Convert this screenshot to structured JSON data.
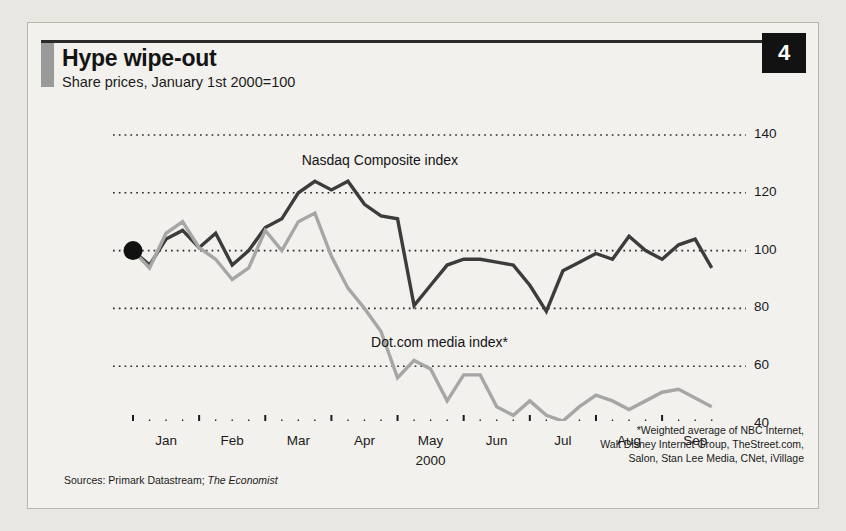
{
  "header": {
    "title": "Hype wipe-out",
    "subtitle": "Share prices, January 1st 2000=100",
    "number": "4"
  },
  "footnote": "*Weighted average of NBC Internet,\nWalt Disney Internet Group, TheStreet.com,\nSalon, Stan Lee Media, CNet, iVillage",
  "sources_prefix": "Sources: Primark Datastream; ",
  "sources_italic": "The Economist",
  "colors": {
    "nasdaq": "#3c3c3c",
    "dotcom": "#a6a6a6",
    "gridline": "#2b2b2b",
    "axis": "#1a1a1a",
    "panel": "#f2f1ed",
    "number_box": "#121212",
    "title_tab": "#9a9a9a"
  },
  "chart_data": {
    "type": "line",
    "title": "Hype wipe-out",
    "subtitle": "Share prices, January 1st 2000=100",
    "xlabel": "2000",
    "ylabel": "",
    "ylim": [
      40,
      140
    ],
    "yticks": [
      40,
      60,
      80,
      100,
      120,
      140
    ],
    "ytick_labels": [
      "40",
      "60",
      "80",
      "100",
      "120",
      "140"
    ],
    "grid": true,
    "grid_style": "dotted",
    "y_axis_position": "right",
    "legend": "inline-annotations",
    "x_categories": [
      "Jan",
      "Feb",
      "Mar",
      "Apr",
      "May",
      "Jun",
      "Jul",
      "Aug",
      "Sep"
    ],
    "x_minor_ticks_per_month": 4,
    "start_marker": {
      "x": 0.0,
      "y": 100,
      "label": "January 1st 2000 = 100"
    },
    "annotations": [
      {
        "text": "Nasdaq Composite index",
        "x_month": 2.55,
        "y": 131
      },
      {
        "text": "Dot.com media index*",
        "x_month": 3.6,
        "y": 68
      }
    ],
    "series": [
      {
        "name": "Nasdaq Composite index",
        "color": "#3c3c3c",
        "x_months": [
          0.0,
          0.25,
          0.5,
          0.75,
          1.0,
          1.25,
          1.5,
          1.75,
          2.0,
          2.25,
          2.5,
          2.75,
          3.0,
          3.25,
          3.5,
          3.75,
          4.0,
          4.25,
          4.5,
          4.75,
          5.0,
          5.25,
          5.5,
          5.75,
          6.0,
          6.25,
          6.5,
          6.75,
          7.0,
          7.25,
          7.5,
          7.75,
          8.0,
          8.25,
          8.5,
          8.75
        ],
        "values": [
          100,
          95,
          104,
          107,
          101,
          106,
          95,
          100,
          108,
          111,
          120,
          124,
          121,
          124,
          116,
          112,
          111,
          81,
          88,
          95,
          97,
          97,
          96,
          95,
          88,
          79,
          93,
          96,
          99,
          97,
          105,
          100,
          97,
          102,
          104,
          94
        ]
      },
      {
        "name": "Dot.com media index*",
        "color": "#a6a6a6",
        "x_months": [
          0.0,
          0.25,
          0.5,
          0.75,
          1.0,
          1.25,
          1.5,
          1.75,
          2.0,
          2.25,
          2.5,
          2.75,
          3.0,
          3.25,
          3.5,
          3.75,
          4.0,
          4.25,
          4.5,
          4.75,
          5.0,
          5.25,
          5.5,
          5.75,
          6.0,
          6.25,
          6.5,
          6.75,
          7.0,
          7.25,
          7.5,
          7.75,
          8.0,
          8.25,
          8.5,
          8.75
        ],
        "values": [
          100,
          94,
          106,
          110,
          101,
          97,
          90,
          94,
          107,
          100,
          110,
          113,
          98,
          87,
          80,
          72,
          56,
          62,
          59,
          48,
          57,
          57,
          46,
          43,
          48,
          43,
          41,
          46,
          50,
          48,
          45,
          48,
          51,
          52,
          49,
          46
        ]
      }
    ]
  }
}
